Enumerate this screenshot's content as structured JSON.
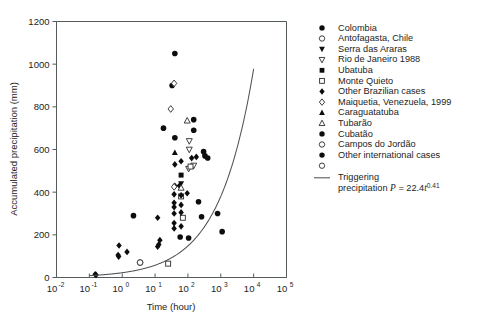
{
  "chart_data": {
    "type": "scatter",
    "title": "",
    "xlabel": "Time (hour)",
    "ylabel": "Accumulated precipitation (mm)",
    "xscale": "log",
    "yscale": "linear",
    "xlim": [
      0.01,
      100000
    ],
    "ylim": [
      0,
      1200
    ],
    "grid": false,
    "legend_position": "right",
    "xticks": [
      {
        "label": "10",
        "exp": "-2",
        "value": 0.01
      },
      {
        "label": "10",
        "exp": "-1",
        "value": 0.1
      },
      {
        "label": "10",
        "exp": "0",
        "value": 1
      },
      {
        "label": "10",
        "exp": "1",
        "value": 10
      },
      {
        "label": "10",
        "exp": "2",
        "value": 100
      },
      {
        "label": "10",
        "exp": "3",
        "value": 1000
      },
      {
        "label": "10",
        "exp": "4",
        "value": 10000
      },
      {
        "label": "10",
        "exp": "5",
        "value": 100000
      }
    ],
    "yticks": [
      0,
      200,
      400,
      600,
      800,
      1000,
      1200
    ],
    "annotations": [],
    "series": [
      {
        "name": "Colombia",
        "marker": "circle-filled",
        "points": [
          [
            40,
            1050
          ],
          [
            33,
            900
          ],
          [
            18,
            700
          ],
          [
            40,
            655
          ],
          [
            150,
            740
          ],
          [
            150,
            690
          ],
          [
            300,
            590
          ],
          [
            330,
            570
          ],
          [
            400,
            560
          ],
          [
            800,
            300
          ],
          [
            1100,
            215
          ]
        ]
      },
      {
        "name": "Antofagasta, Chile",
        "marker": "circle-open",
        "points": [
          [
            3.5,
            70
          ]
        ]
      },
      {
        "name": "Serra das Araras",
        "marker": "triangle-down-filled",
        "points": [
          [
            62,
            440
          ]
        ]
      },
      {
        "name": "Rio de Janeiro 1988",
        "marker": "triangle-down-open",
        "points": [
          [
            110,
            640
          ],
          [
            110,
            600
          ],
          [
            105,
            510
          ],
          [
            150,
            525
          ]
        ]
      },
      {
        "name": "Ubatuba",
        "marker": "square-filled",
        "points": [
          [
            62,
            480
          ]
        ]
      },
      {
        "name": "Monte Quieto",
        "marker": "square-open",
        "points": [
          [
            62,
            380
          ],
          [
            120,
            520
          ],
          [
            70,
            280
          ],
          [
            25,
            65
          ]
        ]
      },
      {
        "name": "Other Brazilian cases",
        "marker": "diamond-filled",
        "points": [
          [
            130,
            560
          ],
          [
            180,
            565
          ],
          [
            40,
            530
          ],
          [
            62,
            545
          ],
          [
            40,
            430
          ],
          [
            55,
            430
          ],
          [
            38,
            390
          ],
          [
            62,
            385
          ],
          [
            38,
            350
          ],
          [
            38,
            330
          ],
          [
            62,
            340
          ],
          [
            38,
            300
          ],
          [
            62,
            305
          ],
          [
            38,
            255
          ],
          [
            38,
            230
          ],
          [
            62,
            240
          ],
          [
            12,
            280
          ],
          [
            14,
            175
          ],
          [
            13,
            155
          ],
          [
            12,
            145
          ],
          [
            95,
            395
          ],
          [
            0.8,
            150
          ],
          [
            1.4,
            120
          ],
          [
            0.75,
            105
          ],
          [
            0.78,
            98
          ],
          [
            0.15,
            15
          ],
          [
            0.16,
            12
          ]
        ]
      },
      {
        "name": "Maiquetia, Venezuela, 1999",
        "marker": "diamond-open",
        "points": [
          [
            38,
            910
          ],
          [
            30,
            790
          ],
          [
            38,
            425
          ]
        ]
      },
      {
        "name": "Caraguatatuba",
        "marker": "triangle-up-filled",
        "points": [
          [
            40,
            585
          ]
        ]
      },
      {
        "name": "Tubarão",
        "marker": "triangle-up-open",
        "points": [
          [
            95,
            735
          ],
          [
            62,
            420
          ]
        ]
      },
      {
        "name": "Cubatão",
        "marker": "circle-filled",
        "points": [
          [
            2.2,
            290
          ]
        ]
      },
      {
        "name": "Campos do Jordão",
        "marker": "circle-open",
        "points": [
          [
            3.5,
            70
          ]
        ]
      },
      {
        "name": "Other international cases",
        "marker": "circle-filled",
        "points": [
          [
            210,
            355
          ],
          [
            260,
            285
          ],
          [
            58,
            190
          ],
          [
            105,
            185
          ]
        ]
      }
    ],
    "curve": {
      "name": "Triggering precipitation",
      "equation_text": "precipitation P = 22.4t",
      "equation_exponent": "0.41",
      "label_line1": "Triggering",
      "coefficient": 22.4,
      "exponent": 0.41,
      "x_range": [
        0.1,
        10000
      ]
    }
  },
  "legend": {
    "items": [
      {
        "label": "Colombia",
        "marker": "circle-filled"
      },
      {
        "label": "Antofagasta, Chile",
        "marker": "circle-open"
      },
      {
        "label": "Serra das Araras",
        "marker": "triangle-down-filled"
      },
      {
        "label": "Rio de Janeiro 1988",
        "marker": "triangle-down-open"
      },
      {
        "label": "Ubatuba",
        "marker": "square-filled"
      },
      {
        "label": "Monte Quieto",
        "marker": "square-open"
      },
      {
        "label": "Other Brazilian cases",
        "marker": "diamond-filled"
      },
      {
        "label": "Maiquetia, Venezuela, 1999",
        "marker": "diamond-open"
      },
      {
        "label": "Caraguatatuba",
        "marker": "triangle-up-filled"
      },
      {
        "label": "Tubarão",
        "marker": "triangle-up-open"
      },
      {
        "label": "Cubatão",
        "marker": "circle-filled"
      },
      {
        "label": "Campos do Jordão",
        "marker": "circle-open"
      },
      {
        "label": "Other international cases",
        "marker": "circle-filled"
      },
      {
        "label": "",
        "marker": "circle-open"
      }
    ],
    "curve_label_line1": "Triggering",
    "curve_label_line2_pre": "precipitation ",
    "curve_label_P": "P",
    "curve_label_eq": " = 22.4",
    "curve_label_t": "t",
    "curve_label_exp": "0.41"
  },
  "colors": {
    "marker_fill": "#0d0d0d",
    "marker_stroke": "#2b2b2b",
    "axis": "#555a5c",
    "curve": "#4f5456",
    "background": "#ffffff"
  }
}
